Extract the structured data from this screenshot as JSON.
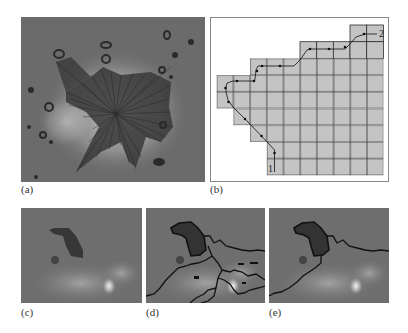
{
  "figure": {
    "panels": [
      {
        "id": "a",
        "label": "(a)",
        "description": "Microscopy image of cell with radial rays from centroid"
      },
      {
        "id": "b",
        "label": "(b)",
        "description": "Grid of pixels with shortest path from point 1 to point 2"
      },
      {
        "id": "c",
        "label": "(c)",
        "description": "Cropped microscopy image region"
      },
      {
        "id": "d",
        "label": "(d)",
        "description": "Cropped image with multiple detected boundary contours"
      },
      {
        "id": "e",
        "label": "(e)",
        "description": "Cropped image with selected single boundary contour"
      }
    ],
    "grid": {
      "start_label": "1",
      "end_label": "2",
      "rows": 9,
      "cols": 10,
      "filled_rows": [
        [
          8,
          9
        ],
        [
          5,
          9
        ],
        [
          2,
          9
        ],
        [
          0,
          9
        ],
        [
          0,
          9
        ],
        [
          1,
          9
        ],
        [
          2,
          9
        ],
        [
          3,
          9
        ],
        [
          3,
          9
        ]
      ]
    },
    "colors": {
      "cell_fill": "#c4c4c4",
      "grid_line": "#333333",
      "path": "#222222",
      "image_bg": "#6a6a6a",
      "contour": "#111111"
    }
  }
}
